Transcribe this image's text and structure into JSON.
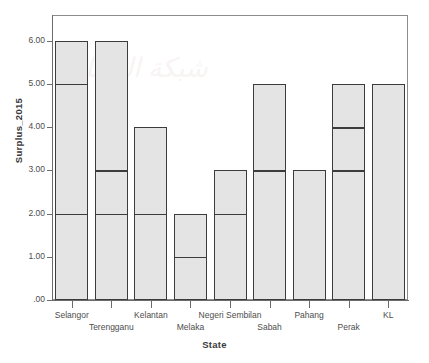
{
  "chart_data": {
    "type": "bar",
    "title": "",
    "subtitle": "",
    "xlabel": "State",
    "ylabel": "Surplus_2015",
    "categories": [
      "Selangor",
      "Terengganu",
      "Kelantan",
      "Melaka",
      "Negeri Sembilan",
      "Sabah",
      "Pahang",
      "Perak",
      "KL"
    ],
    "values": [
      6,
      6,
      4,
      2,
      3,
      5,
      3,
      5,
      5
    ],
    "stack_breaks": [
      [
        2,
        5
      ],
      [
        2,
        3
      ],
      [
        2
      ],
      [
        1
      ],
      [
        2
      ],
      [
        3
      ],
      [],
      [
        3,
        4
      ],
      []
    ],
    "series": [
      {
        "name": "Surplus_2015",
        "values": [
          6,
          6,
          4,
          2,
          3,
          5,
          3,
          5,
          5
        ]
      }
    ],
    "ylim": [
      0,
      6.6
    ],
    "ytick_values": [
      0,
      1,
      2,
      3,
      4,
      5,
      6
    ],
    "ytick_labels": [
      ".00",
      "1.00",
      "2.00",
      "3.00",
      "4.00",
      "5.00",
      "6.00"
    ],
    "grid": false,
    "legend": "none",
    "bar_fill_color": "#e4e4e4",
    "bar_edge_color": "#3c3c3c",
    "frame_color": "#8c8c8c",
    "axis_color": "#6b6b6b",
    "background_color": "#ffffff"
  },
  "watermark": {
    "text": "شبكة البيانات"
  }
}
